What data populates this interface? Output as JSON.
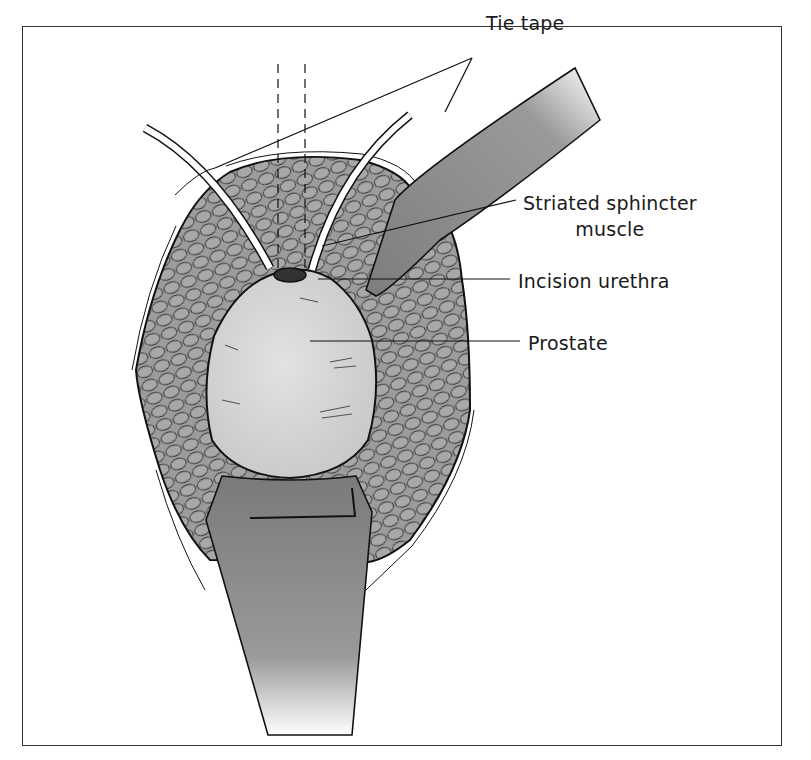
{
  "figure": {
    "type": "surgical illustration",
    "labels": {
      "tie_tape": "Tie tape",
      "striated_sphincter_line1": "Striated sphincter",
      "striated_sphincter_line2": "muscle",
      "incision_urethra": "Incision urethra",
      "prostate": "Prostate"
    },
    "colors": {
      "muscle_fill": "#9a9a9a",
      "prostate_fill": "#d6d6d6",
      "retractor_fill": "#8c8c8c",
      "outline": "#111111",
      "frame": "#333333"
    }
  }
}
